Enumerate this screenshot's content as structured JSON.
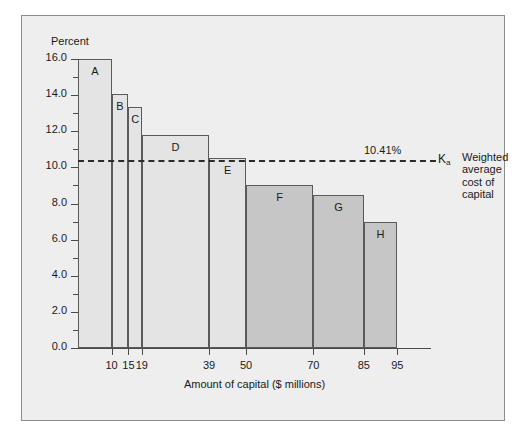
{
  "chart_data": {
    "type": "bar",
    "title": "",
    "xlabel": "Amount of capital ($ millions)",
    "ylabel": "Percent",
    "ylim": [
      0.0,
      16.0
    ],
    "xlim": [
      0,
      105
    ],
    "grid": false,
    "legend": "none",
    "ytick_labels": [
      "0.0",
      "2.0",
      "4.0",
      "6.0",
      "8.0",
      "10.0",
      "12.0",
      "14.0",
      "16.0"
    ],
    "ytick_values": [
      0.0,
      2.0,
      4.0,
      6.0,
      8.0,
      10.0,
      12.0,
      14.0,
      16.0
    ],
    "yminor_values": [
      1.0,
      3.0,
      5.0,
      7.0,
      9.0,
      11.0,
      13.0,
      15.0
    ],
    "xtick_labels": [
      "10",
      "15",
      "19",
      "39",
      "50",
      "70",
      "85",
      "95"
    ],
    "xtick_values": [
      10,
      15,
      19,
      39,
      50,
      70,
      85,
      95
    ],
    "categories": [
      "A",
      "B",
      "C",
      "D",
      "E",
      "F",
      "G",
      "H"
    ],
    "values": [
      16.0,
      14.05,
      13.35,
      11.8,
      10.5,
      9.0,
      8.45,
      7.0
    ],
    "bars": [
      {
        "label": "A",
        "x_start": 0,
        "x_end": 10,
        "value": 16.0,
        "shade": "light"
      },
      {
        "label": "B",
        "x_start": 10,
        "x_end": 15,
        "value": 14.05,
        "shade": "light"
      },
      {
        "label": "C",
        "x_start": 15,
        "x_end": 19,
        "value": 13.35,
        "shade": "light"
      },
      {
        "label": "D",
        "x_start": 19,
        "x_end": 39,
        "value": 11.8,
        "shade": "light"
      },
      {
        "label": "E",
        "x_start": 39,
        "x_end": 50,
        "value": 10.5,
        "shade": "light"
      },
      {
        "label": "F",
        "x_start": 50,
        "x_end": 70,
        "value": 9.0,
        "shade": "dark"
      },
      {
        "label": "G",
        "x_start": 70,
        "x_end": 85,
        "value": 8.45,
        "shade": "dark"
      },
      {
        "label": "H",
        "x_start": 85,
        "x_end": 95,
        "value": 7.0,
        "shade": "dark"
      }
    ],
    "annotations": [
      {
        "kind": "threshold-line",
        "value": 10.41,
        "value_label": "10.41%",
        "symbol": "Ka",
        "symbol_base": "K",
        "symbol_sub": "a",
        "description_lines": [
          "Weighted",
          "average",
          "cost of",
          "capital"
        ],
        "style": "dashed"
      }
    ]
  },
  "colors": {
    "page_background": "#ffffff",
    "panel_background": "#eeeeee",
    "panel_border": "#8c8c8c",
    "bar_light": "#e4e4e4",
    "bar_dark": "#c6c6c6",
    "bar_outline": "#5a5a5a",
    "axis": "#4a4a4a",
    "text": "#1a1a1a",
    "dashed_line": "#2b2b2b"
  }
}
